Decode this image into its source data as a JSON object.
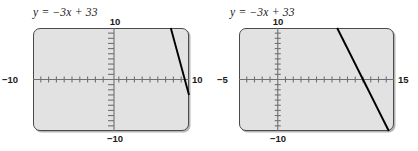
{
  "panels": [
    {
      "id": "left",
      "equation": "y = −3x + 33",
      "window": {
        "xmin": -10,
        "xmax": 10,
        "ymin": -10,
        "ymax": 10,
        "xscl": 1,
        "yscl": 1
      },
      "labels": {
        "xmin": "−10",
        "xmax": "10",
        "ymax": "10",
        "ymin": "−10"
      },
      "chart_data": {
        "type": "line",
        "title": "y = −3x + 33",
        "xlabel": "",
        "ylabel": "",
        "xlim": [
          -10,
          10
        ],
        "ylim": [
          -10,
          10
        ],
        "xtick_labels": [
          "−10",
          "10"
        ],
        "ytick_labels": [
          "−10",
          "10"
        ],
        "grid": false,
        "legend": "none",
        "series": [
          {
            "name": "y = −3x + 33",
            "equation_slope": -3,
            "equation_intercept": 33,
            "visible_segment": {
              "x": [
                7.667,
                10
              ],
              "y": [
                10,
                -3
              ]
            },
            "comment": "Only a short steep segment in the upper-right corner is visible in this window."
          }
        ]
      }
    },
    {
      "id": "right",
      "equation": "y = −3x + 33",
      "window": {
        "xmin": -5,
        "xmax": 15,
        "ymin": -10,
        "ymax": 10,
        "xscl": 1,
        "yscl": 1
      },
      "labels": {
        "xmin": "−5",
        "xmax": "15",
        "ymax": "10",
        "ymin": "−10"
      },
      "chart_data": {
        "type": "line",
        "title": "y = −3x + 33",
        "xlabel": "",
        "ylabel": "",
        "xlim": [
          -5,
          15
        ],
        "ylim": [
          -10,
          10
        ],
        "xtick_labels": [
          "−5",
          "15"
        ],
        "ytick_labels": [
          "−10",
          "10"
        ],
        "grid": false,
        "legend": "none",
        "series": [
          {
            "name": "y = −3x + 33",
            "equation_slope": -3,
            "equation_intercept": 33,
            "visible_segment": {
              "x": [
                7.667,
                14.333
              ],
              "y": [
                10,
                -10
              ]
            },
            "x_intercept": 11,
            "comment": "The full steep descending line crosses the x-axis at x = 11."
          }
        ]
      }
    }
  ]
}
